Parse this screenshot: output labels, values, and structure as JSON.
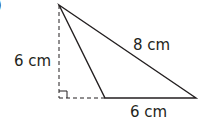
{
  "figure": {
    "marker": ")",
    "labels": {
      "height": "6 cm",
      "hypotenuse": "8 cm",
      "base": "6 cm"
    },
    "colors": {
      "stroke": "#231f20",
      "background": "#ffffff"
    }
  }
}
